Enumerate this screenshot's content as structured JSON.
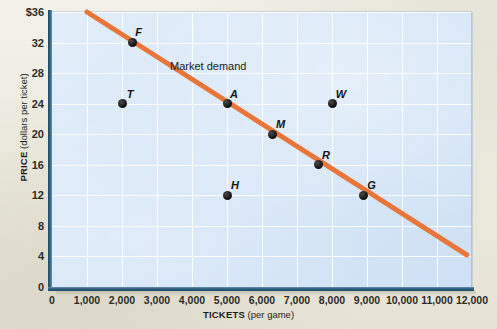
{
  "chart_data": {
    "type": "scatter",
    "title": "",
    "xlabel_bold": "TICKETS",
    "xlabel_note": "(per game)",
    "ylabel_bold": "PRICE",
    "ylabel_note": "(dollars per ticket)",
    "xlim": [
      0,
      12000
    ],
    "ylim": [
      0,
      36
    ],
    "grid": true,
    "legend_position": "inline-annotation",
    "x_ticks": [
      {
        "value": 0,
        "label": "0"
      },
      {
        "value": 1000,
        "label": "1,000"
      },
      {
        "value": 2000,
        "label": "2,000"
      },
      {
        "value": 3000,
        "label": "3,000"
      },
      {
        "value": 4000,
        "label": "4,000"
      },
      {
        "value": 5000,
        "label": "5,000"
      },
      {
        "value": 6000,
        "label": "6,000"
      },
      {
        "value": 7000,
        "label": "7,000"
      },
      {
        "value": 8000,
        "label": "8,000"
      },
      {
        "value": 9000,
        "label": "9,000"
      },
      {
        "value": 10000,
        "label": "10,000"
      },
      {
        "value": 11000,
        "label": "11,000"
      },
      {
        "value": 12000,
        "label": "12,000"
      }
    ],
    "y_ticks": [
      {
        "value": 36,
        "label": "$36"
      },
      {
        "value": 32,
        "label": "32"
      },
      {
        "value": 28,
        "label": "28"
      },
      {
        "value": 24,
        "label": "24"
      },
      {
        "value": 20,
        "label": "20"
      },
      {
        "value": 16,
        "label": "16"
      },
      {
        "value": 12,
        "label": "12"
      },
      {
        "value": 8,
        "label": "8"
      },
      {
        "value": 4,
        "label": "4"
      },
      {
        "value": 0,
        "label": "0"
      }
    ],
    "points": [
      {
        "label": "F",
        "x": 2300,
        "y": 32,
        "on_line": true,
        "label_dx": 6,
        "label_dy": -11
      },
      {
        "label": "T",
        "x": 2000,
        "y": 24,
        "on_line": false,
        "label_dx": 8,
        "label_dy": -10
      },
      {
        "label": "A",
        "x": 5000,
        "y": 24,
        "on_line": true,
        "label_dx": 7,
        "label_dy": -10
      },
      {
        "label": "W",
        "x": 8000,
        "y": 24,
        "on_line": false,
        "label_dx": 9,
        "label_dy": -10
      },
      {
        "label": "M",
        "x": 6300,
        "y": 20,
        "on_line": true,
        "label_dx": 8,
        "label_dy": -10
      },
      {
        "label": "R",
        "x": 7600,
        "y": 16,
        "on_line": true,
        "label_dx": 8,
        "label_dy": -10
      },
      {
        "label": "H",
        "x": 5000,
        "y": 12,
        "on_line": false,
        "label_dx": 8,
        "label_dy": -10
      },
      {
        "label": "G",
        "x": 8900,
        "y": 12,
        "on_line": true,
        "label_dx": 8,
        "label_dy": -10
      }
    ],
    "demand_line": {
      "name": "Market demand",
      "color": "#e8763a",
      "x_start": 1000,
      "y_start": 36,
      "x_end": 11850,
      "y_end": 4.2,
      "width_px": 5
    },
    "annotations": [
      {
        "text": "Market demand",
        "x_px": 170,
        "y_px": 60
      }
    ],
    "colors": {
      "plot_background": "#d6e6f7",
      "page_background": "#efeee6",
      "axis": "#214966",
      "gridline": "#ffffff",
      "demand_line": "#e8763a",
      "point": "#000000"
    }
  }
}
